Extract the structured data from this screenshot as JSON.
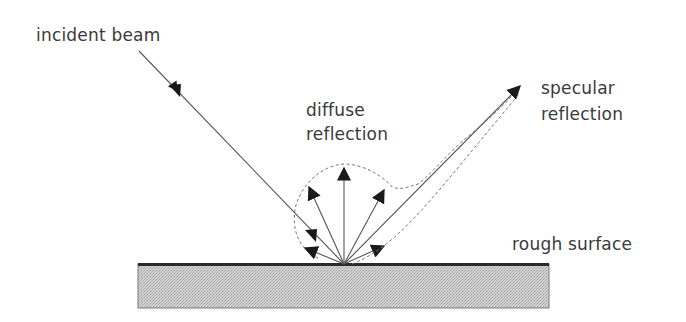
{
  "diagram": {
    "labels": {
      "incident_beam": "incident beam",
      "diffuse_line1": "diffuse",
      "diffuse_line2": "reflection",
      "specular_line1": "specular",
      "specular_line2": "reflection",
      "rough_surface": "rough surface"
    },
    "colors": {
      "line": "#555555",
      "arrowhead": "#1a1a1a",
      "dashed": "#777777",
      "surface_fill": "#c8c8c8",
      "surface_top": "#2a2a2a",
      "text": "#3a3a3a"
    }
  }
}
